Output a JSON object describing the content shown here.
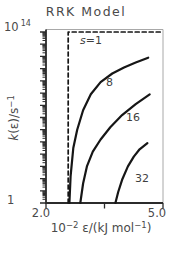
{
  "figure": {
    "title": "RRK Model",
    "labels": {
      "y_top_base": "10",
      "y_top_exp": "14",
      "y_bottom": "1",
      "y_title_k": "k",
      "y_title_mid": "(ε)/s",
      "y_title_exp": "−1",
      "x_tick_left": "2.0",
      "x_tick_right": "5.0",
      "x_title_base": "10",
      "x_title_exp": "−2",
      "x_title_mid": " ε/(kJ mol",
      "x_title_exp2": "−1",
      "x_title_end": ")"
    },
    "colors": {
      "curve": "#161616",
      "frame_dark": "#2b2b2b",
      "frame_light": "#a8a8a8",
      "tick": "#2b2b2b",
      "text": "#4a4a4a"
    }
  },
  "chart_data": {
    "type": "line",
    "title": "RRK Model",
    "xlabel": "10^−2 ε/(kJ mol^−1)",
    "ylabel": "k(ε)/s^−1",
    "x_range": [
      2.0,
      5.0
    ],
    "y_scale": "log10",
    "y_log_range": [
      0,
      14
    ],
    "x_ticks": [
      2.0,
      3.5,
      5.0
    ],
    "x_tick_labels": [
      "2.0",
      "",
      "5.0"
    ],
    "y_tick_labels": {
      "top": "10^14",
      "bottom": "1"
    },
    "grid": false,
    "legend": "inline curve labels",
    "pixel": {
      "x0": 46,
      "x1": 163,
      "y0": 203,
      "y1": 32
    },
    "series": [
      {
        "s": 1,
        "style": "dashed",
        "label_parts": [
          {
            "text": "s",
            "italic": true
          },
          {
            "text": "=1",
            "italic": false
          }
        ],
        "label_px": [
          80,
          35
        ],
        "points": [
          [
            2.57,
            0
          ],
          [
            2.57,
            14
          ],
          [
            5.0,
            14
          ]
        ]
      },
      {
        "s": 8,
        "style": "solid",
        "label_parts": [
          {
            "text": "8",
            "italic": false
          }
        ],
        "label_px": [
          106,
          77
        ],
        "points": [
          [
            2.6,
            0
          ],
          [
            2.63,
            2.2
          ],
          [
            2.7,
            4.5
          ],
          [
            2.8,
            6.0
          ],
          [
            2.95,
            7.6
          ],
          [
            3.15,
            8.9
          ],
          [
            3.4,
            9.9
          ],
          [
            3.7,
            10.6
          ],
          [
            4.0,
            11.1
          ],
          [
            4.3,
            11.5
          ],
          [
            4.62,
            11.9
          ]
        ]
      },
      {
        "s": 16,
        "style": "solid",
        "label_parts": [
          {
            "text": "16",
            "italic": false
          }
        ],
        "label_px": [
          126,
          112
        ],
        "points": [
          [
            2.88,
            0
          ],
          [
            2.95,
            1.6
          ],
          [
            3.05,
            3.0
          ],
          [
            3.2,
            4.2
          ],
          [
            3.4,
            5.2
          ],
          [
            3.65,
            6.2
          ],
          [
            3.95,
            7.2
          ],
          [
            4.3,
            8.1
          ],
          [
            4.66,
            8.9
          ]
        ]
      },
      {
        "s": 32,
        "style": "solid",
        "label_parts": [
          {
            "text": "32",
            "italic": false
          }
        ],
        "label_px": [
          135,
          173
        ],
        "points": [
          [
            3.78,
            0
          ],
          [
            3.85,
            0.9
          ],
          [
            3.95,
            1.9
          ],
          [
            4.1,
            3.0
          ],
          [
            4.25,
            3.8
          ],
          [
            4.4,
            4.4
          ],
          [
            4.6,
            4.9
          ]
        ]
      }
    ],
    "y_minor_tick_mantissas": [
      2,
      3,
      4,
      5,
      6,
      7,
      8,
      9
    ]
  }
}
